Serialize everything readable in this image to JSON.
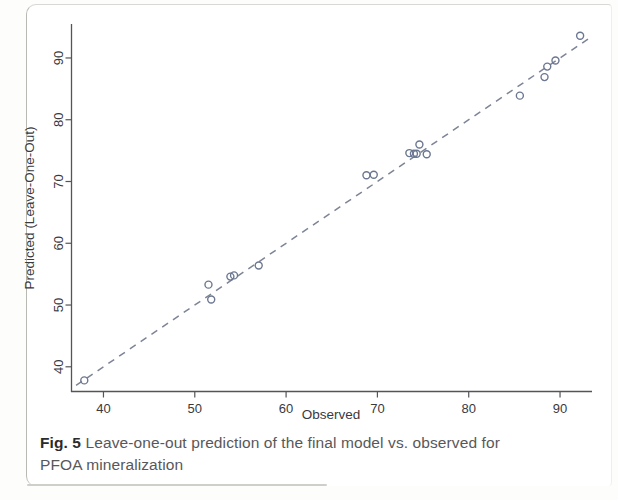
{
  "figure": {
    "caption_label": "Fig. 5",
    "caption_text": "Leave-one-out prediction of the final model vs. observed for",
    "caption_text_line2": "PFOA mineralization"
  },
  "chart_data": {
    "type": "scatter",
    "title": "",
    "xlabel": "Observed",
    "ylabel": "Predicted (Leave-One-Out)",
    "xlim": [
      36.5,
      93.5
    ],
    "ylim": [
      36.0,
      95.5
    ],
    "xticks": [
      40,
      50,
      60,
      70,
      80,
      90
    ],
    "yticks": [
      40,
      50,
      60,
      70,
      80,
      90
    ],
    "xticklabels": [
      "40",
      "50",
      "60",
      "70",
      "80",
      "90"
    ],
    "yticklabels": [
      "40",
      "50",
      "60",
      "70",
      "80",
      "90"
    ],
    "grid": false,
    "legend": false,
    "marker": "open-circle",
    "marker_color": "#6b7790",
    "marker_size": 7,
    "series": [
      {
        "name": "Leave-one-out prediction",
        "points": [
          {
            "x": 37.9,
            "y": 37.8
          },
          {
            "x": 51.5,
            "y": 53.3
          },
          {
            "x": 51.8,
            "y": 50.9
          },
          {
            "x": 53.9,
            "y": 54.6
          },
          {
            "x": 54.3,
            "y": 54.8
          },
          {
            "x": 57.0,
            "y": 56.4
          },
          {
            "x": 68.8,
            "y": 71.0
          },
          {
            "x": 69.6,
            "y": 71.1
          },
          {
            "x": 73.5,
            "y": 74.6
          },
          {
            "x": 74.0,
            "y": 74.5
          },
          {
            "x": 74.3,
            "y": 74.5
          },
          {
            "x": 74.6,
            "y": 76.0
          },
          {
            "x": 75.4,
            "y": 74.4
          },
          {
            "x": 85.6,
            "y": 83.9
          },
          {
            "x": 88.3,
            "y": 86.9
          },
          {
            "x": 88.6,
            "y": 88.6
          },
          {
            "x": 89.5,
            "y": 89.6
          },
          {
            "x": 92.2,
            "y": 93.6
          }
        ]
      }
    ],
    "reference_line": {
      "name": "1:1 identity line",
      "style": "dashed",
      "color": "#7d8496",
      "x_start": 37.0,
      "y_start": 37.0,
      "x_end": 93.2,
      "y_end": 93.2
    }
  }
}
